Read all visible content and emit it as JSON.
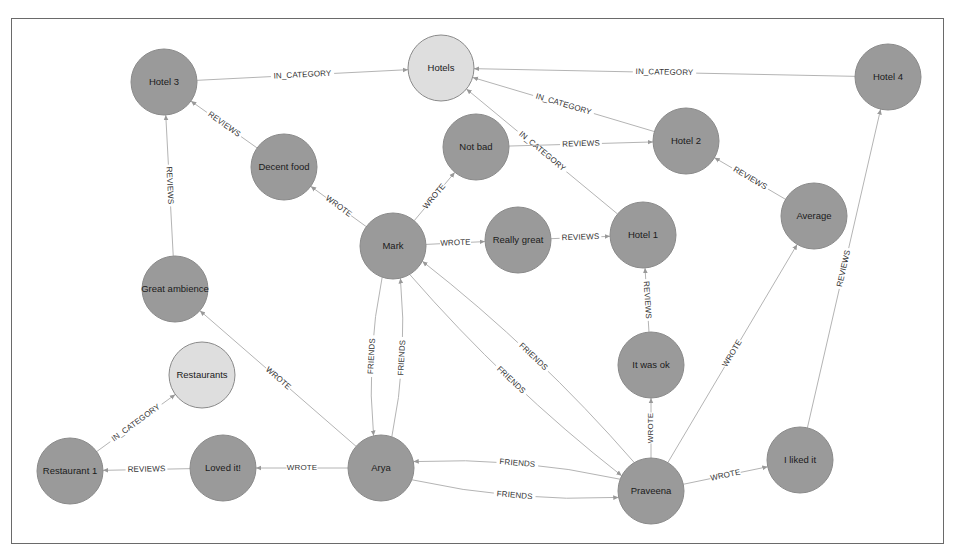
{
  "colors": {
    "node_default": "#9a9a9a",
    "node_category": "#dedede",
    "edge": "#b4b4b4",
    "frame": "#6a6a6a",
    "background": "#ffffff"
  },
  "graph": {
    "node_radius": 33,
    "nodes": [
      {
        "id": "hotel3",
        "label": "Hotel 3",
        "x": 164,
        "y": 82,
        "type": "hotel"
      },
      {
        "id": "hotels",
        "label": "Hotels",
        "x": 441,
        "y": 68,
        "type": "category"
      },
      {
        "id": "hotel4",
        "label": "Hotel 4",
        "x": 888,
        "y": 77,
        "type": "hotel"
      },
      {
        "id": "hotel2",
        "label": "Hotel 2",
        "x": 686,
        "y": 141,
        "type": "hotel"
      },
      {
        "id": "notbad",
        "label": "Not bad",
        "x": 476,
        "y": 147,
        "type": "review"
      },
      {
        "id": "decentfood",
        "label": "Decent food",
        "x": 284,
        "y": 167,
        "type": "review"
      },
      {
        "id": "mark",
        "label": "Mark",
        "x": 393,
        "y": 246,
        "type": "person"
      },
      {
        "id": "reallygreat",
        "label": "Really great",
        "x": 518,
        "y": 240,
        "type": "review"
      },
      {
        "id": "hotel1",
        "label": "Hotel 1",
        "x": 643,
        "y": 235,
        "type": "hotel"
      },
      {
        "id": "average",
        "label": "Average",
        "x": 814,
        "y": 216,
        "type": "review"
      },
      {
        "id": "greatambience",
        "label": "Great ambience",
        "x": 175,
        "y": 289,
        "type": "review"
      },
      {
        "id": "restaurants",
        "label": "Restaurants",
        "x": 202,
        "y": 375,
        "type": "category"
      },
      {
        "id": "itwasok",
        "label": "It was ok",
        "x": 651,
        "y": 365,
        "type": "review"
      },
      {
        "id": "ilikedit",
        "label": "I liked it",
        "x": 800,
        "y": 460,
        "type": "review"
      },
      {
        "id": "restaurant1",
        "label": "Restaurant 1",
        "x": 70,
        "y": 471,
        "type": "restaurant"
      },
      {
        "id": "lovedit",
        "label": "Loved it!",
        "x": 223,
        "y": 468,
        "type": "review"
      },
      {
        "id": "arya",
        "label": "Arya",
        "x": 381,
        "y": 468,
        "type": "person"
      },
      {
        "id": "praveena",
        "label": "Praveena",
        "x": 651,
        "y": 491,
        "type": "person"
      }
    ],
    "edges": [
      {
        "from": "hotel3",
        "to": "hotels",
        "label": "IN_CATEGORY",
        "curve": 0
      },
      {
        "from": "hotel4",
        "to": "hotels",
        "label": "IN_CATEGORY",
        "curve": 0
      },
      {
        "from": "hotel2",
        "to": "hotels",
        "label": "IN_CATEGORY",
        "curve": 0
      },
      {
        "from": "hotel1",
        "to": "hotels",
        "label": "IN_CATEGORY",
        "curve": 0
      },
      {
        "from": "decentfood",
        "to": "hotel3",
        "label": "REVIEWS",
        "curve": 0
      },
      {
        "from": "greatambience",
        "to": "hotel3",
        "label": "REVIEWS",
        "curve": 0
      },
      {
        "from": "notbad",
        "to": "hotel2",
        "label": "REVIEWS",
        "curve": 0
      },
      {
        "from": "reallygreat",
        "to": "hotel1",
        "label": "REVIEWS",
        "curve": 0
      },
      {
        "from": "average",
        "to": "hotel2",
        "label": "REVIEWS",
        "curve": 0
      },
      {
        "from": "itwasok",
        "to": "hotel1",
        "label": "REVIEWS",
        "curve": 0
      },
      {
        "from": "ilikedit",
        "to": "hotel4",
        "label": "REVIEWS",
        "curve": 0
      },
      {
        "from": "lovedit",
        "to": "restaurant1",
        "label": "REVIEWS",
        "curve": 0
      },
      {
        "from": "restaurant1",
        "to": "restaurants",
        "label": "IN_CATEGORY",
        "curve": 0
      },
      {
        "from": "mark",
        "to": "decentfood",
        "label": "WROTE",
        "curve": 0
      },
      {
        "from": "mark",
        "to": "notbad",
        "label": "WROTE",
        "curve": 0
      },
      {
        "from": "mark",
        "to": "reallygreat",
        "label": "WROTE",
        "curve": 0
      },
      {
        "from": "arya",
        "to": "greatambience",
        "label": "WROTE",
        "curve": 0
      },
      {
        "from": "arya",
        "to": "lovedit",
        "label": "WROTE",
        "curve": 0
      },
      {
        "from": "praveena",
        "to": "itwasok",
        "label": "WROTE",
        "curve": 0
      },
      {
        "from": "praveena",
        "to": "average",
        "label": "WROTE",
        "curve": 0
      },
      {
        "from": "praveena",
        "to": "ilikedit",
        "label": "WROTE",
        "curve": 0
      },
      {
        "from": "mark",
        "to": "arya",
        "label": "FRIENDS",
        "curve": 12
      },
      {
        "from": "arya",
        "to": "mark",
        "label": "FRIENDS",
        "curve": 12
      },
      {
        "from": "mark",
        "to": "praveena",
        "label": "FRIENDS",
        "curve": 14
      },
      {
        "from": "praveena",
        "to": "mark",
        "label": "FRIENDS",
        "curve": 14
      },
      {
        "from": "arya",
        "to": "praveena",
        "label": "FRIENDS",
        "curve": 14
      },
      {
        "from": "praveena",
        "to": "arya",
        "label": "FRIENDS",
        "curve": 14
      }
    ]
  }
}
